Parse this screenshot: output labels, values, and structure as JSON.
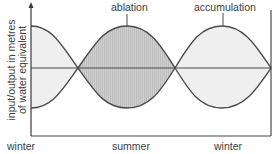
{
  "diagram": {
    "y_axis_label_line1": "input/output in metres",
    "y_axis_label_line2": "of water equivalent",
    "x_labels": [
      "winter",
      "summer",
      "winter"
    ],
    "annotations": {
      "ablation": "ablation",
      "accumulation": "accumulation"
    },
    "colors": {
      "line": "#4a4a4a",
      "ablation_fill": "#c9c9c9",
      "accumulation_fill": "#ececec",
      "background": "#ffffff",
      "text": "#3c3c3c"
    }
  }
}
